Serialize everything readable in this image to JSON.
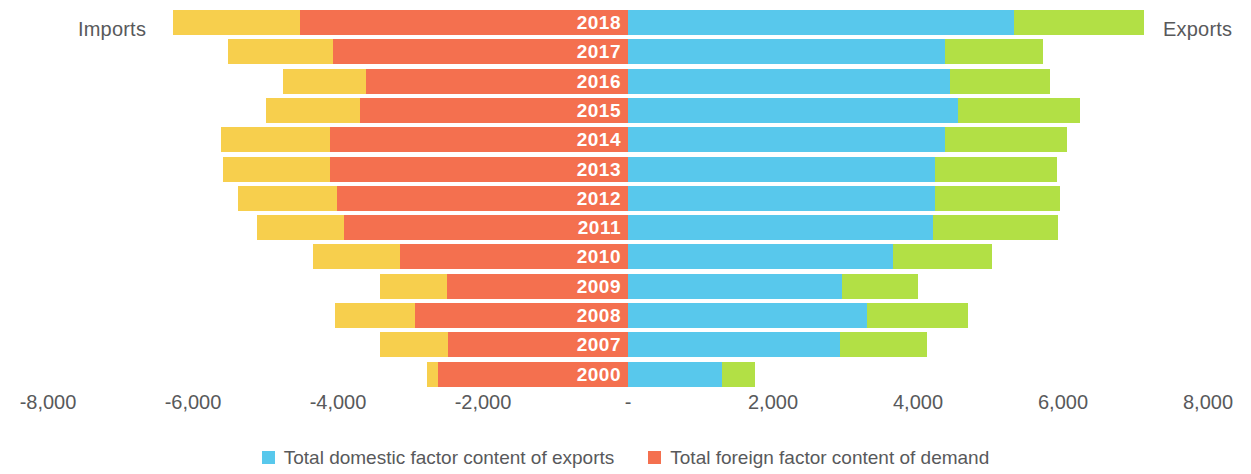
{
  "labels": {
    "imports": "Imports",
    "exports": "Exports"
  },
  "colors": {
    "foreign_factor_content_of_exports": "#f7cf4d",
    "total_foreign_factor_content_of_demand": "#f4704f",
    "total_domestic_factor_content_of_exports": "#58c8ec",
    "domestic_factor_content_of_imports": "#b2e045",
    "text": "#58595b",
    "year_label": "#ffffff"
  },
  "axis": {
    "ticks": [
      {
        "label": "-8,000",
        "value": -8000
      },
      {
        "label": "-6,000",
        "value": -6000
      },
      {
        "label": "-4,000",
        "value": -4000
      },
      {
        "label": "-2,000",
        "value": -2000
      },
      {
        "label": "-",
        "value": 0
      },
      {
        "label": "2,000",
        "value": 2000
      },
      {
        "label": "4,000",
        "value": 4000
      },
      {
        "label": "6,000",
        "value": 6000
      },
      {
        "label": "8,000",
        "value": 8000
      }
    ],
    "min": -8000,
    "max": 8000
  },
  "legend": [
    {
      "label": "Total domestic factor content of exports",
      "color": "#58c8ec"
    },
    {
      "label": "Total foreign factor content of demand",
      "color": "#f4704f"
    }
  ],
  "chart_data": {
    "type": "bar",
    "orientation": "horizontal",
    "stacked": true,
    "diverging": true,
    "title": "",
    "xlabel": "",
    "ylabel": "",
    "xlim": [
      -8000,
      8000
    ],
    "grid": false,
    "legend_position": "bottom-center",
    "annotations": [
      "Imports",
      "Exports"
    ],
    "categories": [
      "2018",
      "2017",
      "2016",
      "2015",
      "2014",
      "2013",
      "2012",
      "2011",
      "2010",
      "2009",
      "2008",
      "2007",
      "2000"
    ],
    "series": [
      {
        "name": "Foreign factor content (outer import segment)",
        "color": "#f7cf4d",
        "side": "left",
        "values": [
          -1752,
          -1448,
          -1145,
          -1297,
          -1503,
          -1476,
          -1366,
          -1200,
          -1200,
          -924,
          -1103,
          -938,
          -152
        ]
      },
      {
        "name": "Total foreign factor content of demand",
        "color": "#f4704f",
        "side": "left",
        "values": [
          -4524,
          -4069,
          -3614,
          -3697,
          -4110,
          -4110,
          -4014,
          -3917,
          -3145,
          -2497,
          -2938,
          -2483,
          -2621
        ]
      },
      {
        "name": "Total domestic factor content of exports",
        "color": "#58c8ec",
        "side": "right",
        "values": [
          5324,
          4372,
          4441,
          4552,
          4372,
          4234,
          4234,
          4207,
          3655,
          2952,
          3297,
          2924,
          1297
        ]
      },
      {
        "name": "Domestic factor content (outer export segment)",
        "color": "#b2e045",
        "side": "right",
        "values": [
          1793,
          1352,
          1379,
          1683,
          1683,
          1683,
          1724,
          1724,
          1366,
          1048,
          1393,
          1200,
          455
        ]
      }
    ],
    "totals": {
      "imports": [
        -6276,
        -5517,
        -4759,
        -4994,
        -5614,
        -5586,
        -5380,
        -5117,
        -4345,
        -3421,
        -4041,
        -3421,
        -2773
      ],
      "exports": [
        7117,
        5724,
        5821,
        6234,
        6055,
        5917,
        5959,
        5931,
        5021,
        4000,
        4690,
        4124,
        1752
      ]
    }
  },
  "bars": [
    {
      "year": "2018",
      "imp_outer_start": -6276,
      "imp_inner_start": -4524,
      "exp_inner_end": 5324,
      "exp_outer_end": 7117
    },
    {
      "year": "2017",
      "imp_outer_start": -5517,
      "imp_inner_start": -4069,
      "exp_inner_end": 4372,
      "exp_outer_end": 5724
    },
    {
      "year": "2016",
      "imp_outer_start": -4759,
      "imp_inner_start": -3614,
      "exp_inner_end": 4441,
      "exp_outer_end": 5821
    },
    {
      "year": "2015",
      "imp_outer_start": -4994,
      "imp_inner_start": -3697,
      "exp_inner_end": 4552,
      "exp_outer_end": 6234
    },
    {
      "year": "2014",
      "imp_outer_start": -5614,
      "imp_inner_start": -4110,
      "exp_inner_end": 4372,
      "exp_outer_end": 6055
    },
    {
      "year": "2013",
      "imp_outer_start": -5586,
      "imp_inner_start": -4110,
      "exp_inner_end": 4234,
      "exp_outer_end": 5917
    },
    {
      "year": "2012",
      "imp_outer_start": -5380,
      "imp_inner_start": -4014,
      "exp_inner_end": 4234,
      "exp_outer_end": 5959
    },
    {
      "year": "2011",
      "imp_outer_start": -5117,
      "imp_inner_start": -3917,
      "exp_inner_end": 4207,
      "exp_outer_end": 5931
    },
    {
      "year": "2010",
      "imp_outer_start": -4345,
      "imp_inner_start": -3145,
      "exp_inner_end": 3655,
      "exp_outer_end": 5021
    },
    {
      "year": "2009",
      "imp_outer_start": -3421,
      "imp_inner_start": -2497,
      "exp_inner_end": 2952,
      "exp_outer_end": 4000
    },
    {
      "year": "2008",
      "imp_outer_start": -4041,
      "imp_inner_start": -2938,
      "exp_inner_end": 3297,
      "exp_outer_end": 4690
    },
    {
      "year": "2007",
      "imp_outer_start": -3421,
      "imp_inner_start": -2483,
      "exp_inner_end": 2924,
      "exp_outer_end": 4124
    },
    {
      "year": "2000",
      "imp_outer_start": -2773,
      "imp_inner_start": -2621,
      "exp_inner_end": 1297,
      "exp_outer_end": 1752
    }
  ]
}
